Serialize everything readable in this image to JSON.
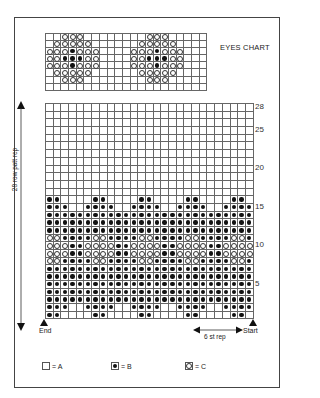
{
  "eyes_chart": {
    "title": "EYES CHART",
    "columns": 21,
    "rows": [
      "..CCC........CCC.....",
      ".CCCCC......CCCCC....",
      "CCCBCCC....CCCBCCC...",
      "CCBBBCC....CCBBBCC...",
      "CCCBCCC....CCCBCCC...",
      ".CCCCC......CCCCC....",
      "..CCC........CCC.....",
      "....................."
    ]
  },
  "main_chart": {
    "columns": 27,
    "total_rows": 28,
    "row_labels": [
      {
        "row": 28,
        "text": "28"
      },
      {
        "row": 25,
        "text": "25"
      },
      {
        "row": 20,
        "text": "20"
      },
      {
        "row": 15,
        "text": "15"
      },
      {
        "row": 10,
        "text": "10"
      },
      {
        "row": 5,
        "text": "5"
      }
    ],
    "rows_top_to_bottom": [
      "...........................",
      "...........................",
      "...........................",
      "...........................",
      "...........................",
      "...........................",
      "...........................",
      "...........................",
      "...........................",
      "...........................",
      "...........................",
      "...........................",
      "BB....BB....BB....BB....BB.",
      "BBB..BBBB..BBBB..BBBB..BBBB",
      "BBBBBBBBBBBBBBBBBBBBBBBBBBB",
      "BBBBBBBBBBBBBBBBBBBBBBBBBBB",
      "BBBBBBBBBBBBBBBBBBBBBBBBBBB",
      "CCBBBBCCBBBBCCBBBBCCBBBBCCB",
      "CCCBBCCCCBBCCCCBBCCCCBBCCCC",
      "CCCBBCCCCBBCCCCBBCCCCBBCCCC",
      "CCBBBBCCBBBBCCBBBBCCBBBBCCB",
      "BBBBBBBBBBBBBBBBBBBBBBBBBBB",
      "BBBBBBBBBBBBBBBBBBBBBBBBBBB",
      "BBBBBBBBBBBBBBBBBBBBBBBBBBB",
      "BBBBBBBBBBBBBBBBBBBBBBBBBBB",
      "BBBBBBBBBBBBBBBBBBBBBBBBBBB",
      "BBB..BBBB..BBBB..BBBB..BBBB",
      "BB....BB....BB....BB....BB."
    ],
    "side_label": "28 row patt rep",
    "end_label": "End",
    "start_label": "Start",
    "repeat_label": "6 st rep"
  },
  "legend": [
    {
      "symbol": "A",
      "text": "= A"
    },
    {
      "symbol": "B",
      "text": "= B"
    },
    {
      "symbol": "C",
      "text": "= C"
    }
  ]
}
